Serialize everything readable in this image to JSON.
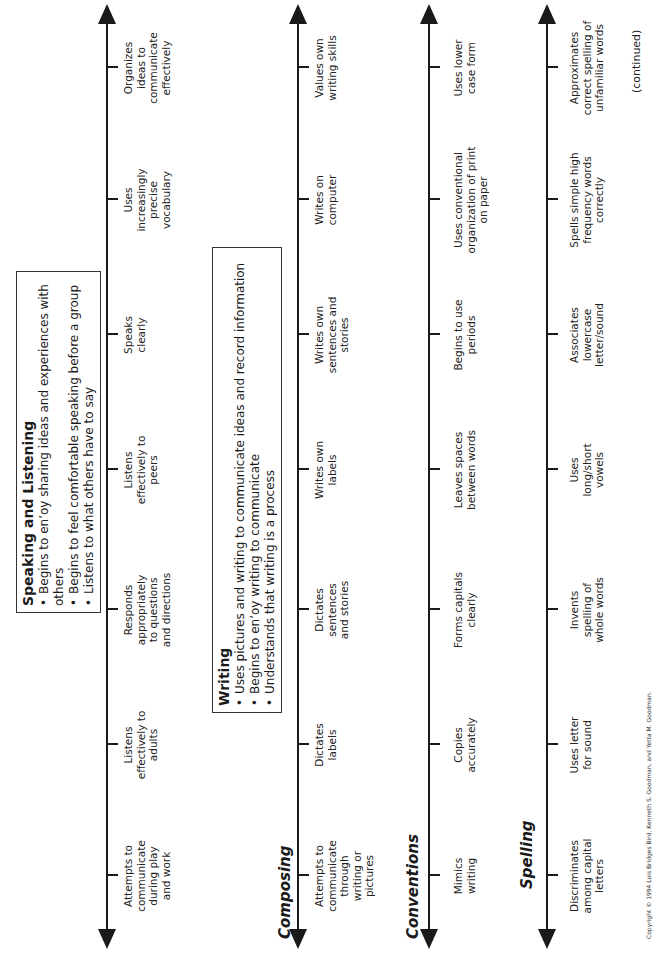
{
  "orientation": "rotated-90-ccw",
  "speaking_listening": {
    "box": {
      "title": "Speaking and Listening",
      "bullets": [
        "Begins to enʼoy sharing ideas and experiences with others",
        "Begins to feel comfortable speaking before a group",
        "Listens to what others have to say"
      ]
    },
    "milestones": [
      "Attempts to communicate during play and work",
      "Listens effectively to adults",
      "Responds appropriately to questions and directions",
      "Listens effectively to peers",
      "Speaks clearly",
      "Uses increasingly precise vocabulary",
      "Organizes ideas to communicate effectively"
    ]
  },
  "writing": {
    "box": {
      "title": "Writing",
      "bullets": [
        "Uses pictures and writing to communicate ideas and record information",
        "Begins to enʼoy writing to communicate",
        "Understands that writing is a process"
      ]
    }
  },
  "composing": {
    "title": "Composing",
    "milestones": [
      "Attempts to communicate through writing or pictures",
      "Dictates labels",
      "Dictates sentences and stories",
      "Writes own labels",
      "Writes own sentences and stories",
      "Writes on computer",
      "Values own writing skills"
    ]
  },
  "conventions": {
    "title": "Conventions",
    "milestones": [
      "Mimics writing",
      "Copies accurately",
      "Forms capitals clearly",
      "Leaves spaces between words",
      "Begins to use periods",
      "Uses conventional organization of print on paper",
      "Uses lower case form"
    ]
  },
  "spelling": {
    "title": "Spelling",
    "milestones": [
      "Discriminates among capital letters",
      "Uses letter for sound",
      "Invents spelling of whole words",
      "Uses long/short vowels",
      "Associates lowercase letter/sound",
      "Spells simple high frequency words correctly",
      "Approximates correct spelling of unfamiliar words"
    ]
  },
  "footer": {
    "continued": "(continued)",
    "copyright": "Copyright © 1994 Lois Bridges Bird, Kenneth S. Goodman, and Yetta M. Goodman."
  }
}
